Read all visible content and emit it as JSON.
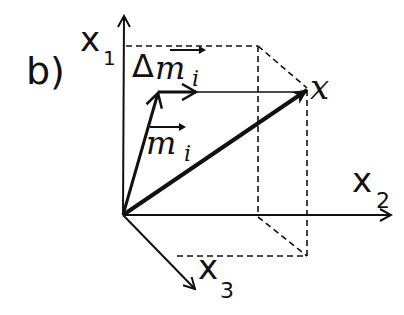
{
  "panel_label": "b)",
  "axes": {
    "x1": {
      "label": "x",
      "subscript": "1"
    },
    "x2": {
      "label": "x",
      "subscript": "2"
    },
    "x3": {
      "label": "x",
      "subscript": "3"
    }
  },
  "vectors": {
    "m_i": {
      "label": "m",
      "subscript": "i"
    },
    "delta_m_i": {
      "prefix": "Δ",
      "label": "m",
      "subscript": "i"
    },
    "x": {
      "label": "x"
    }
  },
  "colors": {
    "ink": "#111111",
    "background": "#ffffff"
  }
}
